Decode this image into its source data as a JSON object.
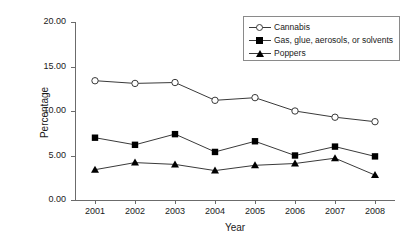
{
  "chart_data": {
    "type": "line",
    "title": "",
    "xlabel": "Year",
    "ylabel": "Percentage",
    "categories": [
      "2001",
      "2002",
      "2003",
      "2004",
      "2005",
      "2006",
      "2007",
      "2008"
    ],
    "ylim": [
      0,
      20
    ],
    "yticks": [
      "0.00",
      "5.00",
      "10.00",
      "15.00",
      "20.00"
    ],
    "ytick_values": [
      0,
      5,
      10,
      15,
      20
    ],
    "grid": false,
    "legend_position": "top-right",
    "series": [
      {
        "name": "Cannabis",
        "marker": "open-circle",
        "values": [
          13.4,
          13.1,
          13.2,
          11.2,
          11.5,
          10.0,
          9.3,
          8.8
        ]
      },
      {
        "name": "Gas, glue, aerosols, or solvents",
        "marker": "filled-square",
        "values": [
          7.0,
          6.2,
          7.4,
          5.4,
          6.6,
          5.0,
          6.0,
          4.9
        ]
      },
      {
        "name": "Poppers",
        "marker": "filled-triangle",
        "values": [
          3.4,
          4.2,
          4.0,
          3.3,
          3.9,
          4.1,
          4.7,
          2.8
        ]
      }
    ],
    "colors": {
      "line": "#3a3a3a",
      "axis": "#6b6b6b",
      "marker_fill": "#000000",
      "open_marker_fill": "#ffffff",
      "text": "#1a1a1a",
      "background": "#ffffff"
    }
  }
}
